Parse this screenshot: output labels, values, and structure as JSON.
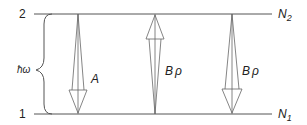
{
  "diagram": {
    "levels": {
      "upper": {
        "number": "2",
        "population": "N",
        "population_sub": "2"
      },
      "lower": {
        "number": "1",
        "population": "N",
        "population_sub": "1"
      }
    },
    "energy_gap_label": "ħω",
    "transitions": [
      {
        "label": "A",
        "label_sub": "",
        "direction": "down",
        "type": "spontaneous emission"
      },
      {
        "label": "B",
        "label_sub": "ρ",
        "direction": "up",
        "type": "absorption"
      },
      {
        "label": "B",
        "label_sub": "ρ",
        "direction": "down",
        "type": "stimulated emission"
      }
    ],
    "colors": {
      "line": "#555555",
      "text": "#222222"
    }
  }
}
